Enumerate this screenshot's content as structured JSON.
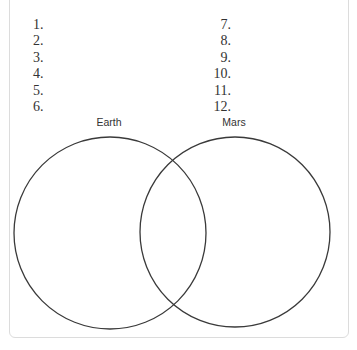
{
  "worksheet": {
    "left_numbers": [
      "1.",
      "2.",
      "3.",
      "4.",
      "5.",
      "6."
    ],
    "right_numbers": [
      "7.",
      "8.",
      "9.",
      "10.",
      "11.",
      "12."
    ]
  },
  "venn": {
    "left_label": "Earth",
    "right_label": "Mars",
    "stroke_color": "#3a3a3a",
    "frame_color": "#dcdcdc"
  }
}
